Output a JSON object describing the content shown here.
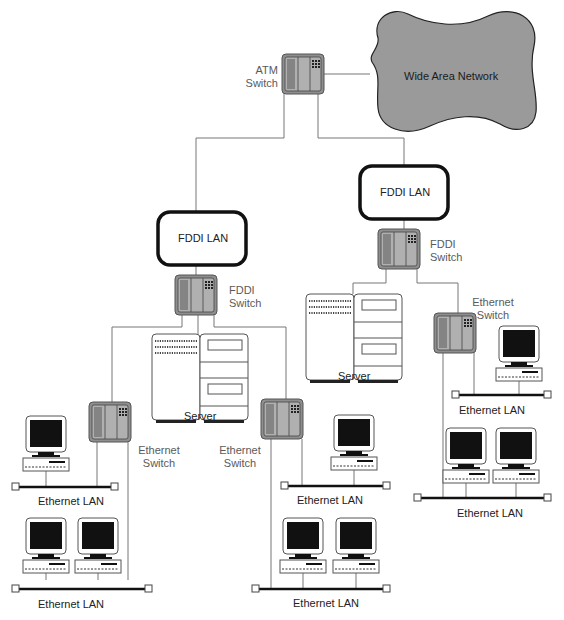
{
  "diagram": {
    "type": "network-topology",
    "wan": {
      "label": "Wide Area Network",
      "fill": "#9a9a9a"
    },
    "atm_switch": {
      "label_line1": "ATM",
      "label_line2": "Switch"
    },
    "fddi_left": {
      "lan_label": "FDDI LAN",
      "switch_line1": "FDDI",
      "switch_line2": "Switch"
    },
    "fddi_right": {
      "lan_label": "FDDI LAN",
      "switch_line1": "FDDI",
      "switch_line2": "Switch"
    },
    "servers": [
      {
        "label": "Server"
      },
      {
        "label": "Server"
      }
    ],
    "ethernet_switches": [
      {
        "label_line1": "Ethernet",
        "label_line2": "Switch"
      },
      {
        "label_line1": "Ethernet",
        "label_line2": "Switch"
      },
      {
        "label_line1": "Ethernet",
        "label_line2": "Switch"
      }
    ],
    "ethernet_lans": [
      {
        "label": "Ethernet LAN"
      },
      {
        "label": "Ethernet LAN"
      },
      {
        "label": "Ethernet LAN"
      },
      {
        "label": "Ethernet LAN"
      },
      {
        "label": "Ethernet LAN"
      },
      {
        "label": "Ethernet LAN"
      }
    ],
    "colors": {
      "switch_fill": "#a8a8a8",
      "switch_border": "#6a6a6a",
      "line": "#777777",
      "lan_bar": "#111111",
      "monitor_screen": "#111111"
    }
  }
}
